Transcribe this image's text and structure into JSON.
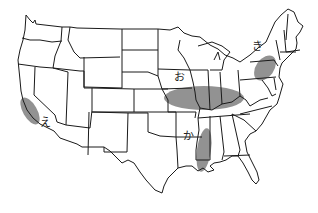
{
  "map": {
    "title": "United States map with shaded agricultural regions",
    "regions": [
      {
        "id": "o",
        "label": "お",
        "description": "Central Midwest band (Kansas/Missouri/Illinois/Indiana/Ohio)",
        "color": "#8c8c8c"
      },
      {
        "id": "ka",
        "label": "か",
        "description": "Lower Mississippi valley (Mississippi/Louisiana border)",
        "color": "#8c8c8c"
      },
      {
        "id": "ki",
        "label": "き",
        "description": "Pennsylvania / southern New York",
        "color": "#8c8c8c"
      },
      {
        "id": "e",
        "label": "え",
        "description": "California Central Valley",
        "color": "#8c8c8c"
      }
    ],
    "colors": {
      "background": "#ffffff",
      "outline": "#1a1a1a",
      "shading": "#8c8c8c"
    }
  }
}
